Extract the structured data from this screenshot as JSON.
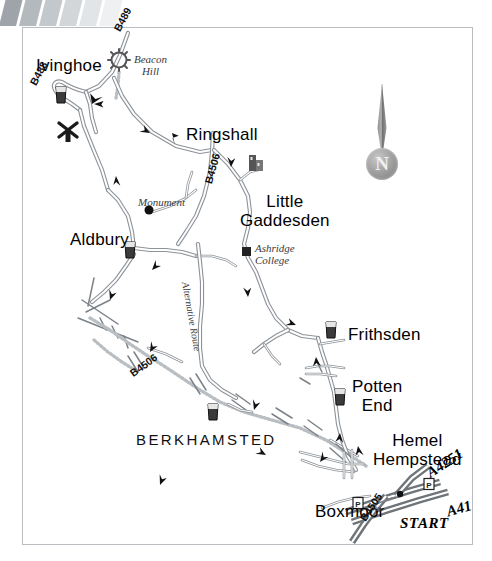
{
  "map": {
    "title": "Ivinghoe and Ashridge cycle route map",
    "frame": {
      "x": 22,
      "y": 27,
      "w": 451,
      "h": 518
    },
    "compass": {
      "label": "N",
      "name": "north-compass"
    },
    "colors": {
      "road_stroke": "#8d9399",
      "road_fill": "#ffffff",
      "main_road_dark": "#6f7479",
      "frame": "#b9bdc2",
      "text": "#111111",
      "deco_bar": "#c8ccd0"
    },
    "places": [
      {
        "id": "ivinghoe",
        "label": "Ivinghoe",
        "x": 36,
        "y": 57,
        "style": "town"
      },
      {
        "id": "ringshall",
        "label": "Ringshall",
        "x": 186,
        "y": 126,
        "style": "town"
      },
      {
        "id": "little-gaddesden",
        "label": "Little\nGaddesden",
        "x": 240,
        "y": 192,
        "style": "town2"
      },
      {
        "id": "aldbury",
        "label": "Aldbury",
        "x": 70,
        "y": 231,
        "style": "town"
      },
      {
        "id": "frithsden",
        "label": "Frithsden",
        "x": 348,
        "y": 326,
        "style": "town"
      },
      {
        "id": "potten-end",
        "label": "Potten\nEnd",
        "x": 352,
        "y": 377,
        "style": "town2"
      },
      {
        "id": "hemel-hempstead",
        "label": "Hemel\nHempstead",
        "x": 373,
        "y": 431,
        "style": "town2"
      },
      {
        "id": "boxmoor",
        "label": "Boxmoor",
        "x": 315,
        "y": 503,
        "style": "town"
      },
      {
        "id": "berkhamsted",
        "label": "BERKHAMSTED",
        "x": 136,
        "y": 432,
        "style": "berk"
      }
    ],
    "features": [
      {
        "id": "beacon-hill",
        "label": "Beacon\nHill",
        "x": 134,
        "y": 53,
        "style": "small-italic"
      },
      {
        "id": "monument",
        "label": "Monument",
        "x": 138,
        "y": 196,
        "style": "small-italic"
      },
      {
        "id": "ashridge-college",
        "label": "Ashridge\nCollege",
        "x": 255,
        "y": 242,
        "style": "small-italic"
      },
      {
        "id": "station",
        "label": "Stn.",
        "x": 371,
        "y": 505,
        "style": "stn"
      }
    ],
    "road_labels": [
      {
        "id": "b489",
        "label": "B489",
        "x": 112,
        "y": 28,
        "rot": -62,
        "style": "road"
      },
      {
        "id": "b488",
        "label": "B488",
        "x": 28,
        "y": 82,
        "rot": -62,
        "style": "road"
      },
      {
        "id": "b4506-ringshall",
        "label": "B4506",
        "x": 203,
        "y": 182,
        "rot": -74,
        "style": "road"
      },
      {
        "id": "b4506-berk",
        "label": "B4506",
        "x": 128,
        "y": 370,
        "rot": -36,
        "style": "road"
      },
      {
        "id": "b4505",
        "label": "B4505",
        "x": 358,
        "y": 517,
        "rot": -56,
        "style": "road"
      },
      {
        "id": "a4251",
        "label": "A4251",
        "x": 424,
        "y": 468,
        "rot": -33,
        "style": "road-big"
      },
      {
        "id": "a41",
        "label": "A41",
        "x": 445,
        "y": 505,
        "rot": -16,
        "style": "road-big"
      },
      {
        "id": "alternative-route",
        "label": "Alternative Route",
        "x": 190,
        "y": 281,
        "rot": 80,
        "style": "altroute"
      }
    ],
    "markers": [
      {
        "id": "start",
        "label": "START",
        "x": 400,
        "y": 516,
        "style": "start"
      }
    ],
    "icons": [
      {
        "id": "windmill-ivinghoe",
        "name": "windmill-icon",
        "x": 58,
        "y": 122
      },
      {
        "id": "pub-ivinghoe",
        "name": "pub-glass-icon",
        "x": 61,
        "y": 95
      },
      {
        "id": "pub-aldbury",
        "name": "pub-glass-icon",
        "x": 130,
        "y": 250
      },
      {
        "id": "pub-berkhamsted",
        "name": "pub-glass-icon",
        "x": 213,
        "y": 412
      },
      {
        "id": "pub-frithsden",
        "name": "pub-glass-icon",
        "x": 331,
        "y": 330
      },
      {
        "id": "pub-potten-end",
        "name": "pub-glass-icon",
        "x": 340,
        "y": 397
      },
      {
        "id": "church-gaddesden",
        "name": "church-icon",
        "x": 255,
        "y": 163
      },
      {
        "id": "sun-beacon-hill",
        "name": "sun-burst-icon",
        "x": 119,
        "y": 60
      },
      {
        "id": "dot-monument",
        "name": "map-dot-icon",
        "x": 149,
        "y": 210
      },
      {
        "id": "square-ashridge",
        "name": "map-square-icon",
        "x": 246,
        "y": 251
      },
      {
        "id": "parking-1",
        "name": "parking-icon",
        "x": 429,
        "y": 484
      },
      {
        "id": "parking-2",
        "name": "parking-icon",
        "x": 358,
        "y": 503
      }
    ]
  }
}
